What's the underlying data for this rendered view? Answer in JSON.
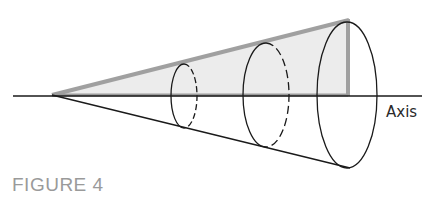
{
  "figure": {
    "caption": "FIGURE 4",
    "axis_label": "Axis",
    "colors": {
      "triangle_fill": "#ebebeb",
      "triangle_edge": "#9b9b9b",
      "line": "#1a1a1a",
      "caption": "#9a9a9a",
      "background": "#ffffff"
    },
    "elements": {
      "axis": {
        "x1": 13,
        "y1": 96,
        "x2": 422,
        "y2": 96
      },
      "apex": {
        "x": 52,
        "y": 95
      },
      "triangle": {
        "points": "52,95 348,20 348,96"
      },
      "lower_edge": {
        "x1": 52,
        "y1": 95,
        "x2": 350,
        "y2": 168
      },
      "cross_sections": [
        {
          "name": "small",
          "cx": 184,
          "cy": 96,
          "rx": 13,
          "ry": 32
        },
        {
          "name": "medium",
          "cx": 266,
          "cy": 95,
          "rx": 23,
          "ry": 52
        },
        {
          "name": "large",
          "cx": 347,
          "cy": 95,
          "rx": 30,
          "ry": 73
        }
      ]
    }
  }
}
